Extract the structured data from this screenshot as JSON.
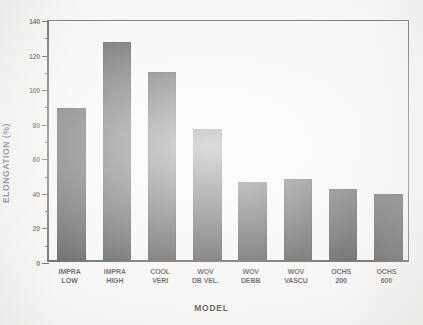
{
  "chart_data": {
    "type": "bar",
    "title": "",
    "xlabel": "MODEL",
    "ylabel": "ELONGATION (%)",
    "ylim": [
      0,
      140
    ],
    "yticks": [
      0,
      20,
      40,
      60,
      80,
      100,
      120,
      140
    ],
    "ytick_labels": [
      "0",
      "20",
      "40",
      "60",
      "80",
      "100",
      "120",
      "140"
    ],
    "grid": false,
    "legend": null,
    "categories": [
      "IMPRA\nLOW",
      "IMPRA\nHIGH",
      "COOL\nVERI",
      "WOV\nDB VEL.",
      "WOV\nDEBB",
      "WOV\nVASCU",
      "OCHS\n200",
      "OCHS\n600"
    ],
    "values": [
      88,
      126,
      109,
      76,
      45,
      47,
      41,
      38
    ],
    "bar_color": "#181818",
    "axis_color": "#1a1a1a",
    "background_color": "#f2f1ee"
  }
}
